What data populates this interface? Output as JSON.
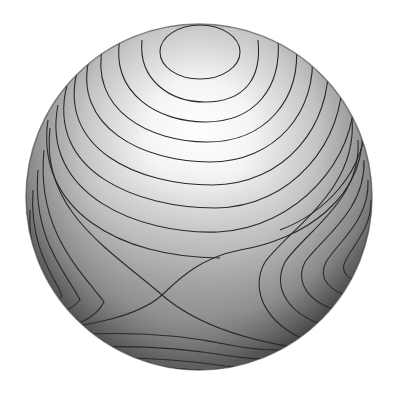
{
  "figure": {
    "title": "Contour lines of a function on the sphere",
    "width": 398,
    "height": 398
  },
  "sphere": {
    "cx": 199,
    "cy": 197,
    "r": 173,
    "highlight": {
      "cx": 200,
      "cy": 120
    },
    "colors": {
      "light": "#ffffff",
      "mid": "#bdbdbd",
      "dark": "#4a4a4a",
      "rim": "#2e2e2e",
      "contour": "#2a2a2a",
      "background": "#ffffff"
    }
  },
  "features": {
    "maximum": {
      "label": "maximum",
      "x": 200,
      "y": 52
    },
    "saddle": {
      "label": "saddle point",
      "x": 162,
      "y": 295
    }
  },
  "contour_count": 26
}
